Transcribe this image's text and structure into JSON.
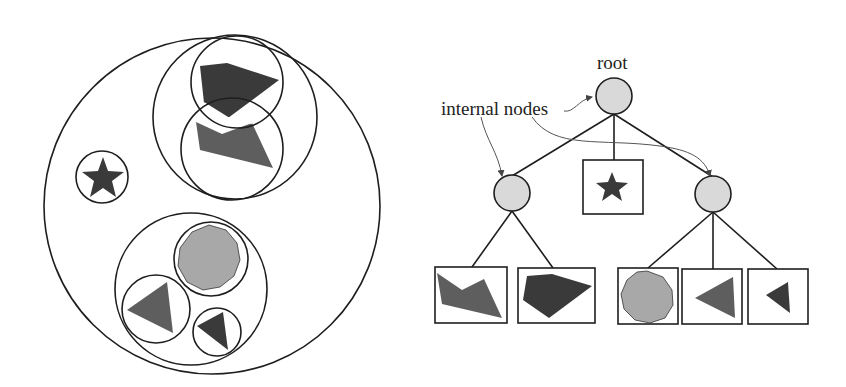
{
  "diagram": {
    "type": "bounding-volume-hierarchy",
    "labels": {
      "root": "root",
      "internal_nodes": "internal nodes"
    },
    "colors": {
      "stroke": "#1e1e1e",
      "node_fill": "#d9d9d9",
      "dark_shape": "#3a3a3a",
      "mid_shape": "#5e5e5e",
      "light_shape": "#a8a8a8",
      "annotation_arrow": "#555555"
    },
    "left_panel": {
      "description": "Nested bounding circles enclosing geometric shapes",
      "shapes": [
        "dark-pentagon",
        "gray-quadrilateral",
        "star",
        "light-octagon",
        "gray-triangle",
        "dark-small-triangle"
      ]
    },
    "tree": {
      "root": {
        "label": "root"
      },
      "children": [
        {
          "kind": "internal",
          "leaves": [
            "gray-quadrilateral",
            "dark-pentagon"
          ]
        },
        {
          "kind": "leaf",
          "shape": "star"
        },
        {
          "kind": "internal",
          "leaves": [
            "light-octagon",
            "gray-triangle",
            "dark-small-triangle"
          ]
        }
      ]
    }
  }
}
